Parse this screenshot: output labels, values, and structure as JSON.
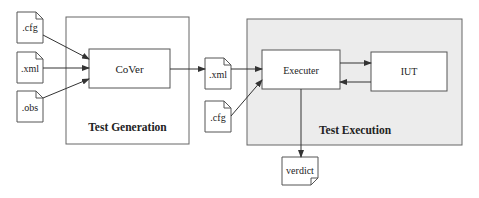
{
  "diagram": {
    "colors": {
      "line": "#444444",
      "box_fill": "#ffffff",
      "execution_fill": "#ececec",
      "text": "#222222"
    },
    "groups": {
      "generation": {
        "title": "Test Generation"
      },
      "execution": {
        "title": "Test Execution"
      }
    },
    "nodes": {
      "input_cfg": {
        "label": ".cfg",
        "type": "document"
      },
      "input_xml": {
        "label": ".xml",
        "type": "document"
      },
      "input_obs": {
        "label": ".obs",
        "type": "document"
      },
      "cover": {
        "label": "CoVer",
        "type": "process"
      },
      "mid_xml": {
        "label": ".xml",
        "type": "document"
      },
      "mid_cfg": {
        "label": ".cfg",
        "type": "document"
      },
      "executer": {
        "label": "Executer",
        "type": "process"
      },
      "iut": {
        "label": "IUT",
        "type": "process"
      },
      "verdict": {
        "label": "verdict",
        "type": "document"
      }
    },
    "edges": [
      {
        "from": "input_cfg",
        "to": "cover"
      },
      {
        "from": "input_xml",
        "to": "cover"
      },
      {
        "from": "input_obs",
        "to": "cover"
      },
      {
        "from": "cover",
        "to": "mid_xml"
      },
      {
        "from": "mid_xml",
        "to": "executer"
      },
      {
        "from": "mid_cfg",
        "to": "executer"
      },
      {
        "from": "executer",
        "to": "iut"
      },
      {
        "from": "iut",
        "to": "executer"
      },
      {
        "from": "executer",
        "to": "verdict"
      }
    ]
  }
}
